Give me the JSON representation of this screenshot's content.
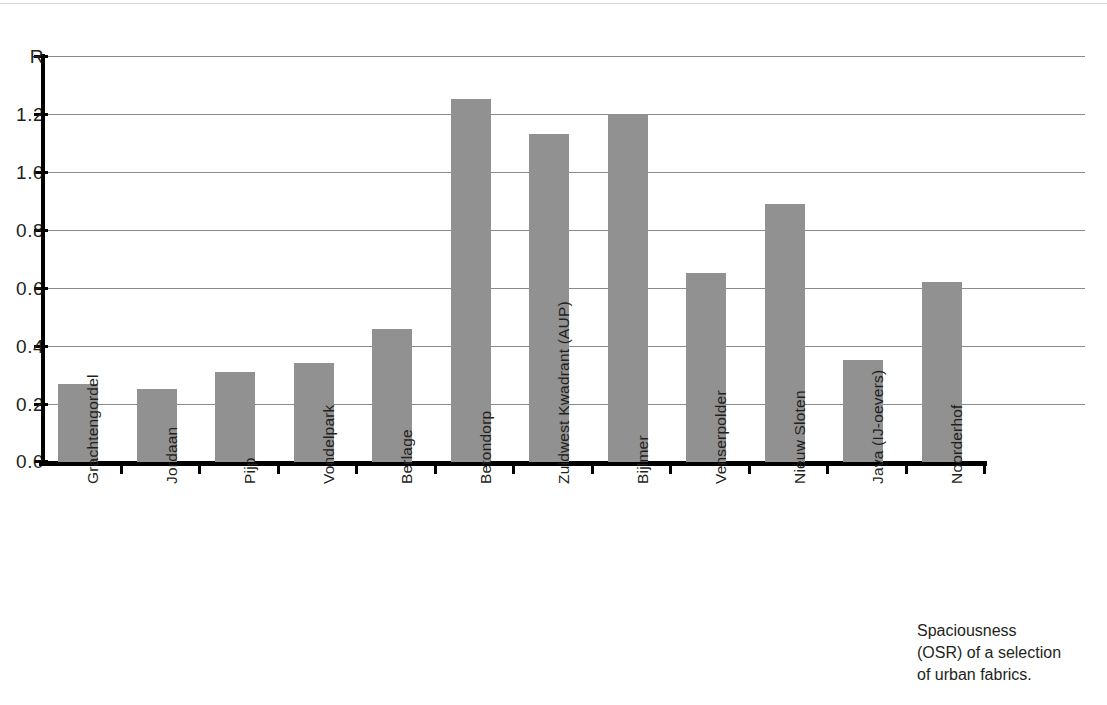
{
  "caption": {
    "line1": "Spaciousness",
    "line2": "(OSR) of a selection",
    "line3": "of urban fabrics."
  },
  "chart_data": {
    "type": "bar",
    "title": "",
    "xlabel": "",
    "ylabel": "OSR",
    "ylabel_visible": "R",
    "ylim": [
      0.0,
      1.4
    ],
    "grid": true,
    "legend": "none",
    "bar_color": "#919191",
    "axis_color": "#000000",
    "gridline_color": "#8a8a8a",
    "ytick_labels": [
      "R",
      "1.2",
      "1.0",
      "0.8",
      "0.6",
      "0.4",
      "0.2",
      "0.0"
    ],
    "ytick_values": [
      1.4,
      1.2,
      1.0,
      0.8,
      0.6,
      0.4,
      0.2,
      0.0
    ],
    "categories": [
      "Grachtengordel",
      "Jordaan",
      "Pijp",
      "Vondelpark",
      "Berlage",
      "Betondorp",
      "Zuidwest Kwadrant (AUP)",
      "Bijlmer",
      "Venserpolder",
      "Nieuw Sloten",
      "Java (IJ-oevers)",
      "Noorderhof"
    ],
    "values": [
      0.27,
      0.25,
      0.31,
      0.34,
      0.46,
      1.25,
      1.13,
      1.2,
      0.65,
      0.89,
      0.35,
      0.62
    ]
  }
}
